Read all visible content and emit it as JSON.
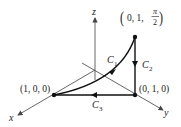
{
  "diagram": {
    "type": "3d-path-diagram",
    "axes": {
      "x_label": "x",
      "y_label": "y",
      "z_label": "z"
    },
    "points": [
      {
        "label": "(1, 0, 0)",
        "coords": [
          1,
          0,
          0
        ]
      },
      {
        "label": "(0, 1, 0)",
        "coords": [
          0,
          1,
          0
        ]
      },
      {
        "label_prefix": "0, 1, ",
        "label_frac_num": "π",
        "label_frac_den": "2",
        "coords": [
          0,
          1,
          "π/2"
        ]
      }
    ],
    "curves": [
      {
        "name": "C",
        "subscript": "1",
        "from": "(1, 0, 0)",
        "to": "(0, 1, π/2)",
        "shape": "curve"
      },
      {
        "name": "C",
        "subscript": "2",
        "from": "(0, 1, π/2)",
        "to": "(0, 1, 0)",
        "shape": "segment"
      },
      {
        "name": "C",
        "subscript": "3",
        "from": "(0, 1, 0)",
        "to": "(1, 0, 0)",
        "shape": "segment"
      }
    ]
  }
}
